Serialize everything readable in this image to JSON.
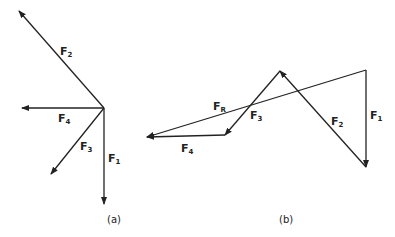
{
  "figure": {
    "panel_a": {
      "caption": "(a)",
      "origin": [
        104,
        108
      ],
      "vectors": [
        {
          "id": "F1",
          "base": "F",
          "sub": "1",
          "to": [
            104,
            204
          ],
          "label_pos": [
            108,
            162
          ]
        },
        {
          "id": "F2",
          "base": "F",
          "sub": "2",
          "to": [
            19,
            11
          ],
          "label_pos": [
            60,
            55
          ]
        },
        {
          "id": "F3",
          "base": "F",
          "sub": "3",
          "to": [
            51,
            174
          ],
          "label_pos": [
            80,
            150
          ]
        },
        {
          "id": "F4",
          "base": "F",
          "sub": "4",
          "to": [
            22,
            108
          ],
          "label_pos": [
            58,
            122
          ]
        }
      ]
    },
    "panel_b": {
      "caption": "(b)",
      "vectors": [
        {
          "id": "F1",
          "base": "F",
          "sub": "1",
          "from": [
            366,
            70
          ],
          "to": [
            366,
            167
          ],
          "label_pos": [
            370,
            119
          ]
        },
        {
          "id": "F2",
          "base": "F",
          "sub": "2",
          "from": [
            366,
            167
          ],
          "to": [
            280,
            71
          ],
          "label_pos": [
            331,
            125
          ]
        },
        {
          "id": "F3",
          "base": "F",
          "sub": "3",
          "from": [
            280,
            71
          ],
          "to": [
            225,
            135
          ],
          "label_pos": [
            250,
            119
          ]
        },
        {
          "id": "F4",
          "base": "F",
          "sub": "4",
          "from": [
            225,
            135
          ],
          "to": [
            147,
            137
          ],
          "label_pos": [
            181,
            152
          ]
        },
        {
          "id": "FR",
          "base": "F",
          "sub": "R",
          "from": [
            366,
            70
          ],
          "to": [
            147,
            137
          ],
          "label_pos": [
            213,
            110
          ]
        }
      ]
    }
  }
}
